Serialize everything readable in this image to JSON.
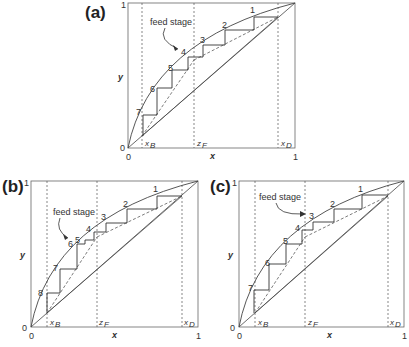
{
  "panels": [
    {
      "id": "a",
      "label": "(a)",
      "box": {
        "x0": 128,
        "y0": 3,
        "x1": 295,
        "y1": 148
      },
      "annotation": "feed stage",
      "feed_stage": 4,
      "stage_labels": [
        "1",
        "2",
        "3",
        "4",
        "5",
        "6",
        "7"
      ],
      "ticks": {
        "x0": "0",
        "x1": "1",
        "y0": "0",
        "y1": "1"
      },
      "axis": {
        "x": "x",
        "y": "y"
      },
      "markers": {
        "xB": "x",
        "xB_sub": "B",
        "zF": "z",
        "zF_sub": "F",
        "xD": "x",
        "xD_sub": "D"
      }
    },
    {
      "id": "b",
      "label": "(b)",
      "box": {
        "x0": 31,
        "y0": 181,
        "x1": 198,
        "y1": 327
      },
      "annotation": "feed stage",
      "feed_stage": 6,
      "stage_labels": [
        "1",
        "2",
        "3",
        "4",
        "5",
        "6",
        "7",
        "8"
      ],
      "ticks": {
        "x0": "0",
        "x1": "1",
        "y0": "0",
        "y1": "1"
      },
      "axis": {
        "x": "x",
        "y": "y"
      },
      "markers": {
        "xB": "x",
        "xB_sub": "B",
        "zF": "z",
        "zF_sub": "F",
        "xD": "x",
        "xD_sub": "D"
      }
    },
    {
      "id": "c",
      "label": "(c)",
      "box": {
        "x0": 239,
        "y0": 181,
        "x1": 404,
        "y1": 327
      },
      "annotation": "feed stage",
      "feed_stage": 3,
      "stage_labels": [
        "1",
        "2",
        "3",
        "4",
        "5",
        "6",
        "7"
      ],
      "ticks": {
        "x0": "0",
        "x1": "1",
        "y0": "0",
        "y1": "1"
      },
      "axis": {
        "x": "x",
        "y": "y"
      },
      "markers": {
        "xB": "x",
        "xB_sub": "B",
        "zF": "z",
        "zF_sub": "F",
        "xD": "x",
        "xD_sub": "D"
      }
    }
  ],
  "params": {
    "xB": 0.09,
    "zF": 0.4,
    "xD": 0.9
  }
}
